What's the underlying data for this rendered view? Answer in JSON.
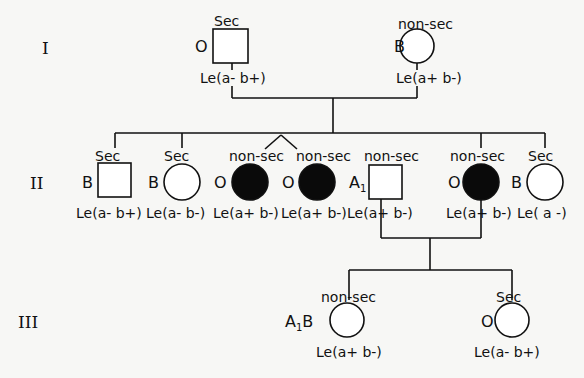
{
  "generations": [
    {
      "label": "I",
      "members": [
        {
          "id": "I-1",
          "sex": "male",
          "shape": "square",
          "affected": false,
          "secretor": "Sec",
          "blood_group": "O",
          "lewis": "Le(a- b+)"
        },
        {
          "id": "I-2",
          "sex": "female",
          "shape": "circle",
          "affected": false,
          "secretor": "non-sec",
          "blood_group": "B",
          "lewis": "Le(a+ b-)"
        }
      ]
    },
    {
      "label": "II",
      "members": [
        {
          "id": "II-1",
          "sex": "male",
          "shape": "square",
          "affected": false,
          "secretor": "Sec",
          "blood_group": "B",
          "lewis": "Le(a- b+)"
        },
        {
          "id": "II-2",
          "sex": "female",
          "shape": "circle",
          "affected": false,
          "secretor": "Sec",
          "blood_group": "B",
          "lewis": "Le(a- b-)"
        },
        {
          "id": "II-3",
          "sex": "female",
          "shape": "circle",
          "affected": true,
          "secretor": "non-sec",
          "blood_group": "O",
          "lewis": "Le(a+ b-)",
          "twin": true
        },
        {
          "id": "II-4",
          "sex": "female",
          "shape": "circle",
          "affected": true,
          "secretor": "non-sec",
          "blood_group": "O",
          "lewis": "Le(a+ b-)",
          "twin": true
        },
        {
          "id": "II-5",
          "sex": "male",
          "shape": "square",
          "affected": false,
          "secretor": "non-sec",
          "blood_group": "A",
          "blood_group_sub": "1",
          "lewis": "Le(a+ b-)",
          "married_in": true
        },
        {
          "id": "II-6",
          "sex": "female",
          "shape": "circle",
          "affected": true,
          "secretor": "non-sec",
          "blood_group": "O",
          "lewis": "Le(a+ b-)"
        },
        {
          "id": "II-7",
          "sex": "female",
          "shape": "circle",
          "affected": false,
          "secretor": "Sec",
          "blood_group": "B",
          "lewis": "Le( a -)"
        }
      ]
    },
    {
      "label": "III",
      "members": [
        {
          "id": "III-1",
          "sex": "female",
          "shape": "circle",
          "affected": false,
          "secretor": "non-sec",
          "blood_group": "A",
          "blood_group_sub": "1",
          "blood_group_suffix": "B",
          "lewis": "Le(a+ b-)"
        },
        {
          "id": "III-2",
          "sex": "female",
          "shape": "circle",
          "affected": false,
          "secretor": "Sec",
          "blood_group": "O",
          "lewis": "Le(a- b+)"
        }
      ]
    }
  ],
  "colors": {
    "line": "#111111",
    "affected_fill": "#0a0a0a",
    "background": "#f7f7f5"
  }
}
